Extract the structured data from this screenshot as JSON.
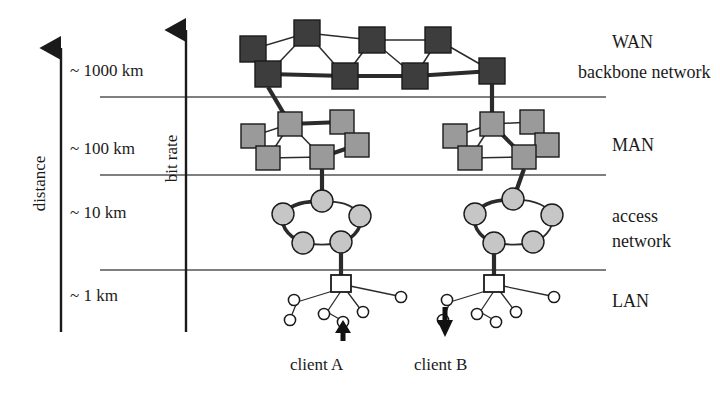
{
  "figure": {
    "kind": "network-hierarchy-diagram",
    "axes": {
      "distance": {
        "title": "distance",
        "ticks": [
          "~ 1000 km",
          "~ 100 km",
          "~ 10 km",
          "~ 1 km"
        ],
        "arrow": "up"
      },
      "bit_rate": {
        "title": "bit rate",
        "arrow": "up"
      }
    },
    "tiers": [
      {
        "id": "wan",
        "label": "WAN",
        "sublabel": "backbone network",
        "distance": "~ 1000 km",
        "node_shape": "square",
        "node_count": 8,
        "node_color": "#3d3d3d"
      },
      {
        "id": "man",
        "label": "MAN",
        "sublabel": "",
        "distance": "~ 100 km",
        "node_shape": "square",
        "node_count": 10,
        "node_color": "#9a9a9a"
      },
      {
        "id": "access",
        "label": "access",
        "sublabel": "network",
        "distance": "~ 10 km",
        "node_shape": "circle",
        "node_count": 10,
        "node_color": "#c6c6c6"
      },
      {
        "id": "lan",
        "label": "LAN",
        "sublabel": "",
        "distance": "~ 1 km",
        "node_shape": "square-hub",
        "node_count": 2,
        "node_color": "#ffffff"
      }
    ],
    "clients": [
      {
        "id": "client-a",
        "label": "client A",
        "arrow": "up"
      },
      {
        "id": "client-b",
        "label": "client B",
        "arrow": "down"
      }
    ],
    "colors": {
      "wan_node": "#3d3d3d",
      "man_node": "#9a9a9a",
      "access_node": "#c6c6c6",
      "lan_node": "#ffffff",
      "line": "#2b2b2b",
      "divider": "#555555",
      "text": "#1a1a1a"
    }
  }
}
